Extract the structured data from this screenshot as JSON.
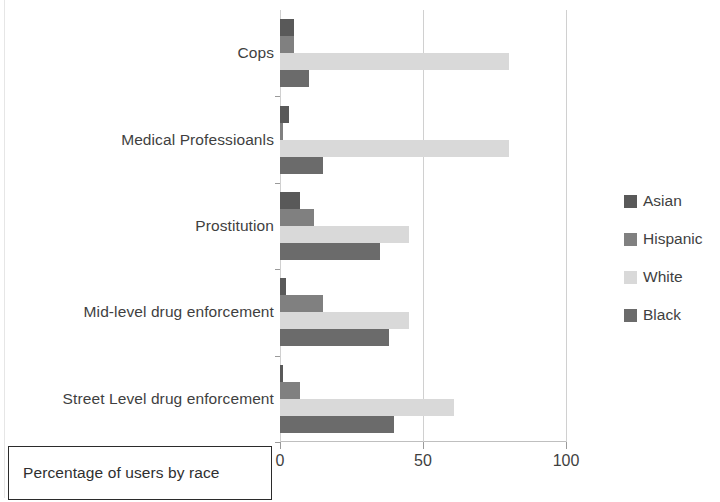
{
  "chart_data": {
    "type": "bar",
    "orientation": "horizontal",
    "title": "",
    "subtitle": "",
    "xlabel": "Percentage of users by race",
    "ylabel": "",
    "xlim": [
      0,
      100
    ],
    "xticks": [
      0,
      50,
      100
    ],
    "xtick_labels": [
      "0",
      "50",
      "100"
    ],
    "grid": true,
    "grid_axis": "x",
    "legend_position": "right",
    "categories": [
      "Cops",
      "Medical Professioanls",
      "Prostitution",
      "Mid-level drug enforcement",
      "Street Level drug enforcement"
    ],
    "series": [
      {
        "name": "Asian",
        "color": "#595959",
        "values": [
          5,
          3,
          7,
          2,
          1
        ]
      },
      {
        "name": "Hispanic",
        "color": "#808080",
        "values": [
          5,
          1,
          12,
          15,
          7
        ]
      },
      {
        "name": "White",
        "color": "#d9d9d9",
        "values": [
          80,
          80,
          45,
          45,
          61
        ]
      },
      {
        "name": "Black",
        "color": "#6b6b6b",
        "values": [
          10,
          15,
          35,
          38,
          40
        ]
      }
    ]
  },
  "axis_title": {
    "text": "Percentage of users by race"
  },
  "legend": {
    "items": [
      {
        "label": "Asian",
        "color": "#595959"
      },
      {
        "label": "Hispanic",
        "color": "#808080"
      },
      {
        "label": "White",
        "color": "#d9d9d9"
      },
      {
        "label": "Black",
        "color": "#6b6b6b"
      }
    ]
  },
  "x_axis": {
    "ticks": [
      {
        "value": 0,
        "label": "0"
      },
      {
        "value": 50,
        "label": "50"
      },
      {
        "value": 100,
        "label": "100"
      }
    ]
  },
  "y_axis": {
    "categories": [
      {
        "label": "Cops"
      },
      {
        "label": "Medical Professioanls"
      },
      {
        "label": "Prostitution"
      },
      {
        "label": "Mid-level drug enforcement"
      },
      {
        "label": "Street Level drug enforcement"
      }
    ]
  }
}
